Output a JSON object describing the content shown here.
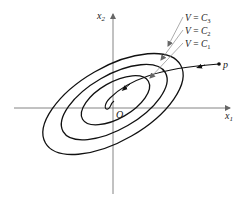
{
  "diagram": {
    "type": "lyapunov-level-sets",
    "axes": {
      "x_label": "x",
      "x_sub": "1",
      "y_label": "x",
      "y_sub": "2",
      "origin_label": "O"
    },
    "level_curves": [
      {
        "label_var": "V",
        "label_eq": " = ",
        "label_const": "C",
        "label_sub": "3"
      },
      {
        "label_var": "V",
        "label_eq": " = ",
        "label_const": "C",
        "label_sub": "2"
      },
      {
        "label_var": "V",
        "label_eq": " = ",
        "label_const": "C",
        "label_sub": "1"
      }
    ],
    "trajectory": {
      "start_label": "p"
    },
    "colors": {
      "curve": "#111111",
      "axis": "#555555",
      "leader": "#888888"
    }
  }
}
